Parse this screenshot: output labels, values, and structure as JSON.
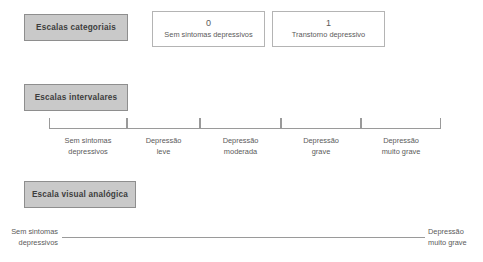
{
  "diagram": {
    "colors": {
      "box_fill": "#c9c9c9",
      "box_border": "#8e8e8e",
      "white_box_border": "#b4b4b4",
      "line": "#9a9a9a",
      "text": "#5a5a5a",
      "background": "#ffffff"
    }
  },
  "rows": {
    "categorical": {
      "label": "Escalas categoriais",
      "options": [
        {
          "code": "0",
          "description": "Sem sintomas depressivos"
        },
        {
          "code": "1",
          "description": "Transtorno depressivo"
        }
      ]
    },
    "interval": {
      "label": "Escalas intervalares",
      "segments": [
        {
          "line1": "Sem sintomas",
          "line2": "depressivos",
          "start": 49,
          "end": 127
        },
        {
          "line1": "Depressão",
          "line2": "leve",
          "start": 127,
          "end": 200
        },
        {
          "line1": "Depressão",
          "line2": "moderada",
          "start": 200,
          "end": 281
        },
        {
          "line1": "Depressão",
          "line2": "grave",
          "start": 281,
          "end": 361
        },
        {
          "line1": "Depressão",
          "line2": "muito grave",
          "start": 361,
          "end": 441
        }
      ]
    },
    "visual_analog": {
      "label": "Escala visual analógica",
      "left_anchor": {
        "line1": "Sem sintomas",
        "line2": "depressivos"
      },
      "right_anchor": {
        "line1": "Depressão",
        "line2": "muito grave"
      }
    }
  }
}
